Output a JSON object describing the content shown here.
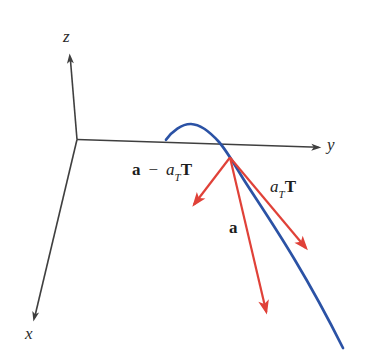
{
  "figure": {
    "colors": {
      "axes": "#3f3f3f",
      "curve": "#2b52a5",
      "vectors": "#e04138",
      "background": "#ffffff",
      "label_text": "#1d1d1d"
    },
    "axis_labels": {
      "x": "x",
      "y": "y",
      "z": "z"
    },
    "vector_labels": {
      "acceleration": "a",
      "tangential": {
        "coefficient": "a",
        "subscript": "T",
        "unit_vector": "T"
      },
      "normal_difference": {
        "vector": "a",
        "operator": "−",
        "coefficient": "a",
        "subscript": "T",
        "unit_vector": "T"
      }
    }
  }
}
